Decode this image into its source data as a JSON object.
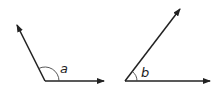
{
  "diagram": {
    "angles": [
      {
        "label": "a",
        "type": "obtuse"
      },
      {
        "label": "b",
        "type": "acute"
      }
    ],
    "colors": {
      "line": "#222222",
      "background": "#ffffff"
    }
  }
}
